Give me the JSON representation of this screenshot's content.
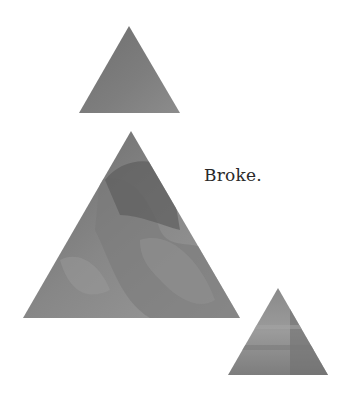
{
  "caption": "Broke.",
  "triangles": [
    {
      "name": "top",
      "points": "129,26 180,113 79,113",
      "color": "#7c7c7c"
    },
    {
      "name": "middle",
      "points": "131,131 240,318 23,318",
      "color": "#858585"
    },
    {
      "name": "bottom",
      "points": "278,288 328,375 228,375",
      "color": "#8a8a8a"
    }
  ]
}
